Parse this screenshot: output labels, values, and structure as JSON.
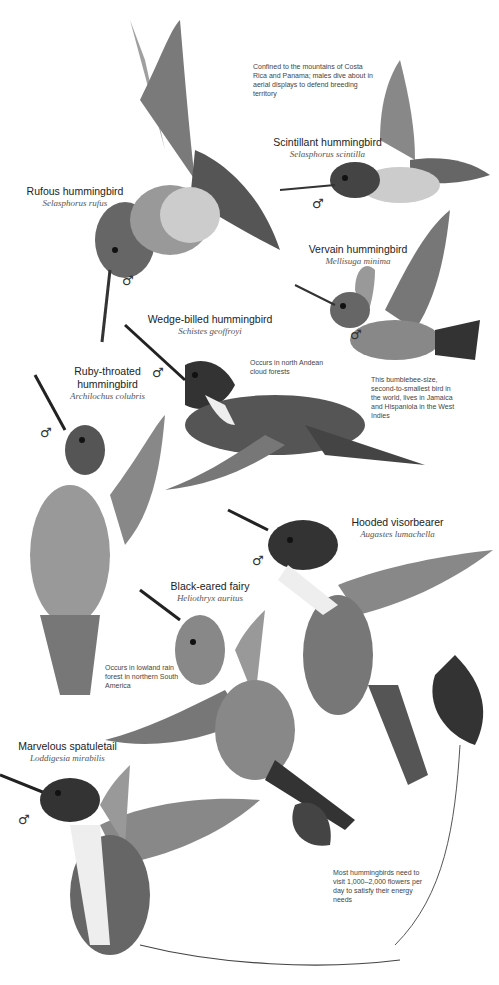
{
  "birds": [
    {
      "common": "Rufous hummingbird",
      "scientific": "Selasphorus rufus",
      "sex": "♂"
    },
    {
      "common": "Scintillant hummingbird",
      "scientific": "Selasphorus scintilla",
      "sex": "♂"
    },
    {
      "common": "Vervain hummingbird",
      "scientific": "Mellisuga minima",
      "sex": "♂"
    },
    {
      "common": "Wedge-billed hummingbird",
      "scientific": "Schistes geoffroyi",
      "sex": "♂"
    },
    {
      "common": "Ruby-throated hummingbird",
      "common_line1": "Ruby-throated",
      "common_line2": "hummingbird",
      "scientific": "Archilochus colubris",
      "sex": "♂"
    },
    {
      "common": "Hooded visorbearer",
      "scientific": "Augastes lumachella",
      "sex": "♂"
    },
    {
      "common": "Black-eared fairy",
      "scientific": "Heliothryx auritus",
      "sex": "♂"
    },
    {
      "common": "Marvelous spatuletail",
      "scientific": "Loddigesia mirabilis",
      "sex": "♂"
    }
  ],
  "notes": {
    "scintillant": "Confined to the mountains of Costa Rica and Panama; males dive about in aerial displays to defend breeding territory",
    "wedge_billed": "Occurs in north Andean cloud forests",
    "vervain": "This bumblebee-size, second-to-smallest bird in the world, lives in Jamaica and Hispaniola in the West Indies",
    "black_eared": "Occurs in lowland rain forest in northern South America",
    "general": "Most hummingbirds need to visit 1,000–2,000 flowers per day to satisfy their energy needs"
  }
}
